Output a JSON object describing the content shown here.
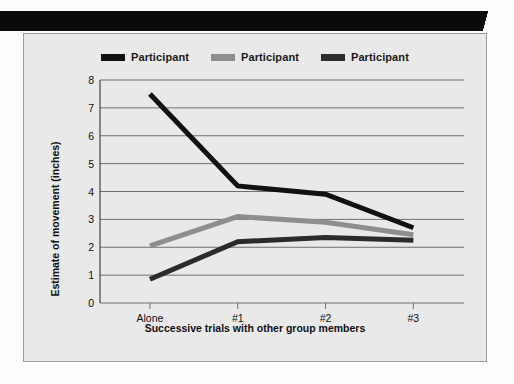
{
  "figure": {
    "panel_background": "#e9e9e9",
    "panel_border": "#9b9b9b",
    "top_bar_color": "#0a0a0a"
  },
  "legend": {
    "position": "top-center",
    "items": [
      {
        "label": "Participant",
        "color": "#111111",
        "name": "legend-item-participant-1"
      },
      {
        "label": "Participant",
        "color": "#8e8e8e",
        "name": "legend-item-participant-2"
      },
      {
        "label": "Participant",
        "color": "#2b2b2b",
        "name": "legend-item-participant-3"
      }
    ]
  },
  "chart_data": {
    "type": "line",
    "title": "",
    "xlabel": "Successive trials with other group members",
    "ylabel": "Estimate of movement (inches)",
    "categories": [
      "Alone",
      "#1",
      "#2",
      "#3"
    ],
    "ylim": [
      0,
      8
    ],
    "yticks": [
      0,
      1,
      2,
      3,
      4,
      5,
      6,
      7,
      8
    ],
    "ytick_labels": [
      "0",
      "1",
      "2",
      "3",
      "4",
      "5",
      "6",
      "7",
      "8"
    ],
    "grid": "horizontal",
    "grid_color": "#6f6f6f",
    "legend_position": "top-center",
    "series": [
      {
        "name": "Participant",
        "color": "#111111",
        "values": [
          7.5,
          4.2,
          3.9,
          2.7
        ]
      },
      {
        "name": "Participant",
        "color": "#8e8e8e",
        "values": [
          2.05,
          3.1,
          2.9,
          2.45
        ]
      },
      {
        "name": "Participant",
        "color": "#2b2b2b",
        "values": [
          0.85,
          2.2,
          2.35,
          2.25
        ]
      }
    ]
  }
}
